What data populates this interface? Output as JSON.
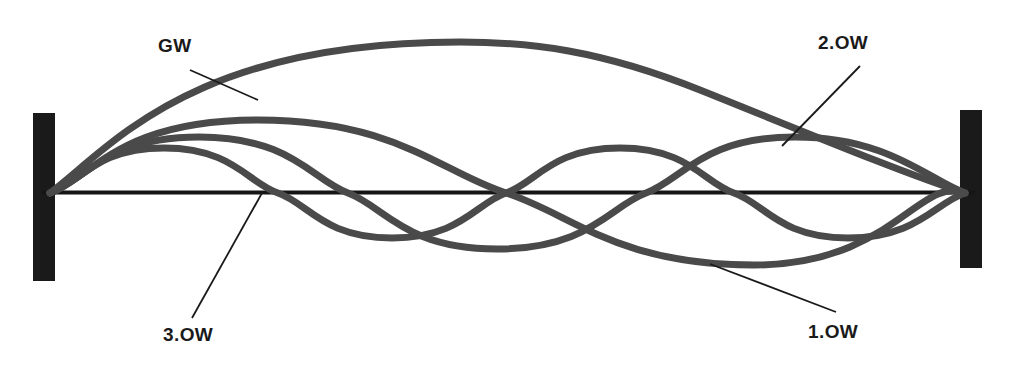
{
  "figure": {
    "kind": "string-vibration-mode-diagram",
    "background_color": "#ffffff",
    "anchor_color": "#1a1a1a",
    "axis_color": "#151515",
    "curve_color": "#4a4a4a",
    "leader_color": "#1a1a1a"
  },
  "labels": {
    "fundamental": "GW",
    "first_overtone": "1.OW",
    "second_overtone": "2.OW",
    "third_overtone": "3.OW"
  },
  "chart_data": {
    "type": "line",
    "title": "",
    "xlabel": "",
    "ylabel": "",
    "grid": false,
    "legend_position": "inline-callouts",
    "x_range": [
      50,
      965
    ],
    "baseline_y": 192,
    "anchors": [
      {
        "name": "left-anchor",
        "x": 33,
        "y": 113,
        "width": 22,
        "height": 168
      },
      {
        "name": "right-anchor",
        "x": 960,
        "y": 110,
        "width": 22,
        "height": 158
      }
    ],
    "series": [
      {
        "name": "GW",
        "label": "GW",
        "harmonic": 1,
        "antinodes": 1,
        "nodes": 2,
        "amplitude_px": 150,
        "peak_y": 42,
        "description": "Fundamental - single arch spanning the full string"
      },
      {
        "name": "1.OW",
        "label": "1.OW",
        "harmonic": 2,
        "antinodes": 2,
        "nodes": 3,
        "amplitude_px": 72,
        "peak_y": 120,
        "description": "First overtone - one crest then one trough"
      },
      {
        "name": "2.OW",
        "label": "2.OW",
        "harmonic": 3,
        "antinodes": 3,
        "nodes": 4,
        "amplitude_px": 55,
        "peak_y": 137,
        "description": "Second overtone - three half waves"
      },
      {
        "name": "3.OW",
        "label": "3.OW",
        "harmonic": 4,
        "antinodes": 4,
        "nodes": 5,
        "amplitude_px": 45,
        "peak_y": 147,
        "description": "Third overtone - four half waves"
      }
    ],
    "callouts": [
      {
        "label": "GW",
        "text_x": 158,
        "text_y": 36,
        "line": [
          190,
          70,
          258,
          100
        ]
      },
      {
        "label": "2.OW",
        "text_x": 818,
        "text_y": 33,
        "line": [
          860,
          66,
          782,
          146
        ]
      },
      {
        "label": "3.OW",
        "text_x": 163,
        "text_y": 325,
        "line": [
          262,
          193,
          192,
          318
        ]
      },
      {
        "label": "1.OW",
        "text_x": 808,
        "text_y": 322,
        "line": [
          710,
          264,
          836,
          312
        ]
      }
    ]
  }
}
